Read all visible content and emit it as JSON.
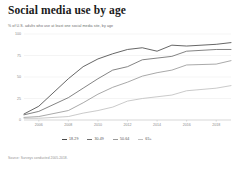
{
  "chart_data": {
    "type": "line",
    "title": "Social media use by age",
    "subtitle": "% of U.S. adults who use at least one social media site, by age",
    "source": "Source: Surveys conducted 2005-2018.",
    "xlabel": "",
    "ylabel": "",
    "xlim": [
      2005,
      2019
    ],
    "ylim": [
      0,
      100
    ],
    "grid": false,
    "legend_position": "bottom",
    "y_ticks": [
      "100",
      "75",
      "50",
      "25",
      "0"
    ],
    "y_tick_values": [
      100,
      75,
      50,
      25,
      0
    ],
    "x_ticks": [
      "2006",
      "2008",
      "2010",
      "2012",
      "2014",
      "2016",
      "2018"
    ],
    "x_tick_values": [
      2006,
      2008,
      2010,
      2012,
      2014,
      2016,
      2018
    ],
    "x": [
      2005,
      2006,
      2008,
      2009,
      2010,
      2011,
      2012,
      2013,
      2014,
      2015,
      2016,
      2018,
      2019
    ],
    "series": [
      {
        "name": "18-29",
        "color": "#4a4a4a",
        "values": [
          7,
          16,
          48,
          62,
          71,
          77,
          82,
          84,
          80,
          87,
          86,
          88,
          90
        ]
      },
      {
        "name": "30-49",
        "color": "#6e6e6e",
        "values": [
          6,
          10,
          26,
          37,
          48,
          58,
          62,
          70,
          72,
          74,
          80,
          82,
          82
        ]
      },
      {
        "name": "50-64",
        "color": "#9a9a9a",
        "values": [
          3,
          4,
          11,
          20,
          30,
          38,
          44,
          51,
          55,
          58,
          64,
          65,
          69
        ]
      },
      {
        "name": "65+",
        "color": "#c0c0c0",
        "values": [
          2,
          2,
          4,
          8,
          11,
          15,
          22,
          25,
          27,
          29,
          34,
          37,
          40
        ]
      }
    ]
  }
}
